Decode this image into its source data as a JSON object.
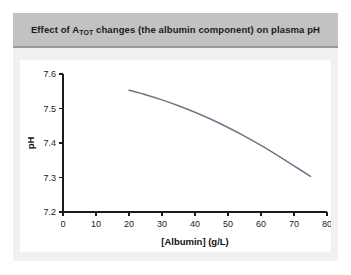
{
  "figure": {
    "title_prefix": "Effect of A",
    "title_subscript": "TOT",
    "title_suffix": " changes (the albumin component) on plasma pH",
    "title_full": "Effect of ATOT changes (the albumin component) on plasma pH",
    "panel_color": "#f1f1f1",
    "title_bar_color": "#c2c2c2",
    "plot_background": "#ffffff"
  },
  "chart_data": {
    "type": "line",
    "title": "Effect of ATOT changes (the albumin component) on plasma pH",
    "xlabel": "[Albumin] (g/L)",
    "ylabel": "pH",
    "xlim": [
      0,
      80
    ],
    "ylim": [
      7.2,
      7.6
    ],
    "xticks": [
      0,
      10,
      20,
      30,
      40,
      50,
      60,
      70,
      80
    ],
    "xtick_labels": [
      "0",
      "10",
      "20",
      "30",
      "40",
      "50",
      "60",
      "70",
      "80"
    ],
    "yticks": [
      7.2,
      7.3,
      7.4,
      7.5,
      7.6
    ],
    "ytick_labels": [
      "7.2",
      "7.3",
      "7.4",
      "7.5",
      "7.6"
    ],
    "grid": false,
    "legend": false,
    "series": [
      {
        "name": "plasma pH vs albumin",
        "color": "#6e7687",
        "x": [
          20,
          25,
          30,
          35,
          40,
          45,
          50,
          55,
          60,
          65,
          70,
          75
        ],
        "y": [
          7.553,
          7.54,
          7.525,
          7.508,
          7.489,
          7.468,
          7.445,
          7.42,
          7.393,
          7.364,
          7.334,
          7.303
        ]
      }
    ]
  }
}
